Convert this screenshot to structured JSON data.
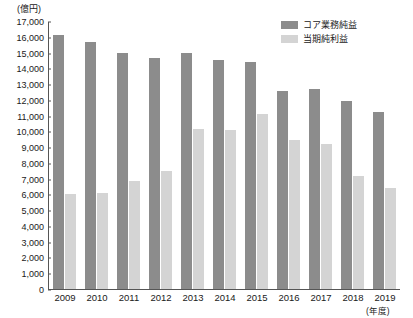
{
  "chart_data": {
    "type": "bar",
    "title": "",
    "unit_label": "(億円)",
    "xlabel": "(年度)",
    "ylabel": "",
    "ylim": [
      0,
      17000
    ],
    "ytick_step": 1000,
    "grid": false,
    "legend_position": "top-right",
    "categories": [
      "2009",
      "2010",
      "2011",
      "2012",
      "2013",
      "2014",
      "2015",
      "2016",
      "2017",
      "2018",
      "2019"
    ],
    "ytick_labels": [
      "17,000",
      "16,000",
      "15,000",
      "14,000",
      "13,000",
      "12,000",
      "11,000",
      "10,000",
      "9,000",
      "8,000",
      "7,000",
      "6,000",
      "5,000",
      "4,000",
      "3,000",
      "2,000",
      "1,000",
      "0"
    ],
    "ytick_values": [
      17000,
      16000,
      15000,
      14000,
      13000,
      12000,
      11000,
      10000,
      9000,
      8000,
      7000,
      6000,
      5000,
      4000,
      3000,
      2000,
      1000,
      0
    ],
    "series": [
      {
        "name": "コア業務純益",
        "color": "#8c8c8c",
        "values": [
          16200,
          15700,
          15050,
          14700,
          15050,
          14600,
          14450,
          12600,
          12750,
          11950,
          11300
        ]
      },
      {
        "name": "当期純利益",
        "color": "#d4d4d4",
        "values": [
          6050,
          6100,
          6850,
          7500,
          10200,
          10150,
          11150,
          9500,
          9250,
          7200,
          6400
        ]
      }
    ]
  },
  "legend": {
    "items": [
      {
        "label": "コア業務純益",
        "color": "#8c8c8c"
      },
      {
        "label": "当期純利益",
        "color": "#d4d4d4"
      }
    ]
  }
}
